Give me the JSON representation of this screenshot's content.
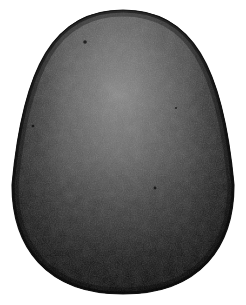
{
  "figure": {
    "style": "halftone-engraving",
    "caption": "",
    "canvas": {
      "width": 246,
      "height": 305,
      "background_color": "#ffffff"
    },
    "egg": {
      "center_x": 123,
      "center_y": 160,
      "left": 12,
      "right": 234,
      "top": 10,
      "bottom": 294,
      "width": 222,
      "height": 284,
      "widest_y": 185,
      "outline_color": "#0d0d0d"
    },
    "shading": {
      "highlight_x": 118,
      "highlight_y": 95,
      "highlight_color": "#787878",
      "midtone_color": "#4a4a4a",
      "shadow_color": "#222222",
      "deep_shadow_color": "#0e0e0e",
      "rim_color": "#101010"
    },
    "texture": {
      "name": "stipple-halftone",
      "grain_opacity": 0.38,
      "grain_size": 2
    },
    "specks": [
      {
        "name": "speck-upper-left",
        "x": 85,
        "y": 42,
        "r": 1.8
      },
      {
        "name": "speck-left",
        "x": 33,
        "y": 126,
        "r": 1.3
      },
      {
        "name": "speck-mid-right",
        "x": 155,
        "y": 188,
        "r": 1.4
      },
      {
        "name": "speck-upper-right",
        "x": 176,
        "y": 108,
        "r": 1.0
      }
    ]
  }
}
